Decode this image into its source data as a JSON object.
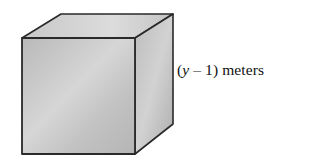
{
  "figure": {
    "shape": "cube",
    "edge_label": {
      "open_paren": "(",
      "variable": "y",
      "operator": " – ",
      "constant": "1",
      "close_paren": ")",
      "unit": " meters",
      "full_text": "(y – 1) meters"
    },
    "colors": {
      "edge": "#2a2a2a",
      "front_face": "#bdbdbd",
      "top_face": "#cfcfcf",
      "side_face": "#b3b3b3",
      "background": "#ffffff"
    }
  }
}
